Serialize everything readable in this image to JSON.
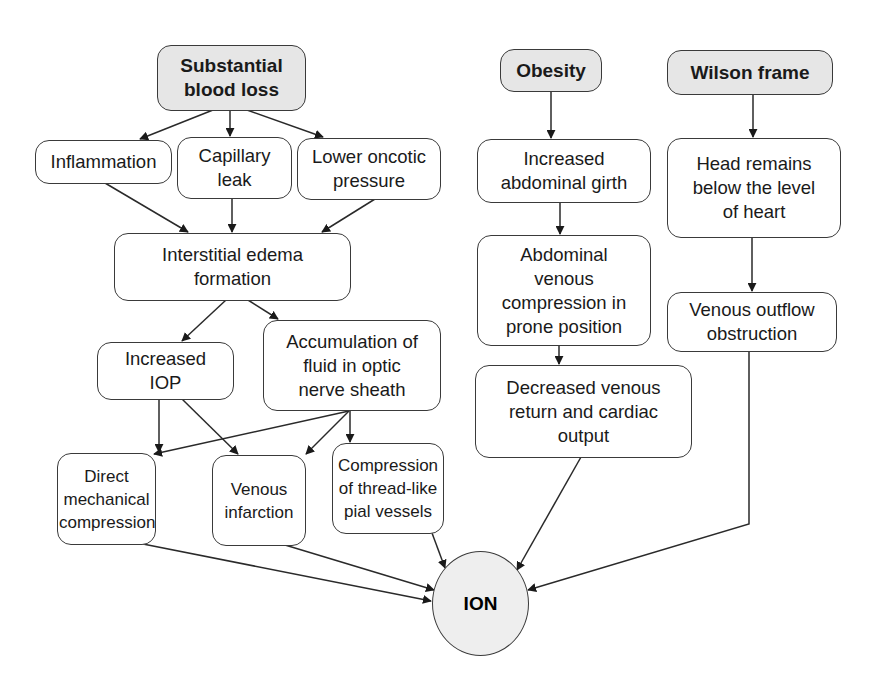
{
  "diagram": {
    "type": "flowchart",
    "colors": {
      "root_fill": "#e6e6e6",
      "node_fill": "#ffffff",
      "stroke": "#3a3a3a",
      "outcome_fill": "#eeeeee"
    },
    "roots": {
      "blood_loss": "Substantial blood loss",
      "obesity": "Obesity",
      "wilson": "Wilson frame"
    },
    "nodes": {
      "inflammation": "Inflammation",
      "capillary_leak": "Capillary leak",
      "lower_oncotic": "Lower oncotic pressure",
      "interstitial_edema": "Interstitial edema formation",
      "increased_iop": "Increased IOP",
      "accumulation": "Accumulation of fluid in optic nerve sheath",
      "direct_compression": "Direct mechanical compression",
      "venous_infarction": "Venous infarction",
      "pial_compression": "Compression of thread-like pial vessels",
      "abdominal_girth": "Increased abdominal girth",
      "abdominal_venous": "Abdominal venous compression in prone position",
      "decreased_return": "Decreased venous return and cardiac output",
      "head_below": "Head remains below the level of heart",
      "outflow_obstruction": "Venous outflow obstruction"
    },
    "outcome": "ION",
    "edges": [
      [
        "Substantial blood loss",
        "Inflammation"
      ],
      [
        "Substantial blood loss",
        "Capillary leak"
      ],
      [
        "Substantial blood loss",
        "Lower oncotic pressure"
      ],
      [
        "Inflammation",
        "Interstitial edema formation"
      ],
      [
        "Capillary leak",
        "Interstitial edema formation"
      ],
      [
        "Lower oncotic pressure",
        "Interstitial edema formation"
      ],
      [
        "Interstitial edema formation",
        "Increased IOP"
      ],
      [
        "Interstitial edema formation",
        "Accumulation of fluid in optic nerve sheath"
      ],
      [
        "Increased IOP",
        "Direct mechanical compression"
      ],
      [
        "Increased IOP",
        "Venous infarction"
      ],
      [
        "Accumulation of fluid in optic nerve sheath",
        "Direct mechanical compression"
      ],
      [
        "Accumulation of fluid in optic nerve sheath",
        "Venous infarction"
      ],
      [
        "Accumulation of fluid in optic nerve sheath",
        "Compression of thread-like pial vessels"
      ],
      [
        "Direct mechanical compression",
        "ION"
      ],
      [
        "Venous infarction",
        "ION"
      ],
      [
        "Compression of thread-like pial vessels",
        "ION"
      ],
      [
        "Obesity",
        "Increased abdominal girth"
      ],
      [
        "Increased abdominal girth",
        "Abdominal venous compression in prone position"
      ],
      [
        "Abdominal venous compression in prone position",
        "Decreased venous return and cardiac output"
      ],
      [
        "Decreased venous return and cardiac output",
        "ION"
      ],
      [
        "Wilson frame",
        "Head remains below the level of heart"
      ],
      [
        "Head remains below the level of heart",
        "Venous outflow obstruction"
      ],
      [
        "Venous outflow obstruction",
        "ION"
      ]
    ]
  }
}
